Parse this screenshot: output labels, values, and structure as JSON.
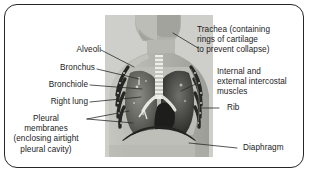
{
  "figure": {
    "type": "labelled-anatomical-diagram",
    "border_color": "#262626",
    "background_color": "#ffffff",
    "text_color": "#1b1b1b"
  },
  "illustration": {
    "name": "thorax-cross-section",
    "description": "Greyscale cut-away of a human head, neck and chest showing trachea, bronchi, both lungs, rib cage, intercostal muscles and the diaphragm",
    "palette": {
      "body": "#b9b9b4",
      "body_shadow": "#8e8e88",
      "lung": "#6e6e6a",
      "lung_dark": "#3a3a38",
      "airway": "#f0efe9",
      "rib": "#2c2c2a",
      "background": "#cfcfcb"
    }
  },
  "labels": [
    {
      "id": "alveoli",
      "text": "Alveoli",
      "align": "right"
    },
    {
      "id": "bronchus",
      "text": "Bronchus",
      "align": "right"
    },
    {
      "id": "bronchiole",
      "text": "Bronchiole",
      "align": "right"
    },
    {
      "id": "right-lung",
      "text": "Right lung",
      "align": "right"
    },
    {
      "id": "pleural-membranes",
      "text": "Pleural\nmembranes\n(enclosing airtight\npleural cavity)",
      "align": "center"
    },
    {
      "id": "trachea",
      "text": "Trachea (containing\nrings of cartilage\nto prevent collapse)",
      "align": "left"
    },
    {
      "id": "intercostal",
      "text": "Internal and\nexternal intercostal\nmuscles",
      "align": "left"
    },
    {
      "id": "rib",
      "text": "Rib",
      "align": "left"
    },
    {
      "id": "diaphragm",
      "text": "Diaphragm",
      "align": "left"
    }
  ]
}
